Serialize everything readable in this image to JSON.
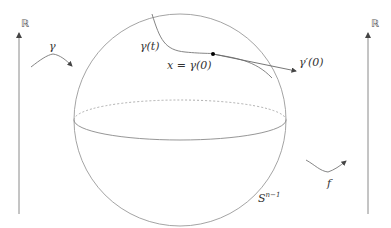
{
  "labels": {
    "left_axis": "ℝ",
    "right_axis": "ℝ",
    "gamma": "γ",
    "gamma_t": "γ(t)",
    "x_eq": "x = γ(0)",
    "gamma_prime": "γ′(0)",
    "f": "f",
    "sphere_base": "S",
    "sphere_exp": "n−1"
  },
  "colors": {
    "stroke": "#8a8a8a",
    "text": "#333333"
  }
}
